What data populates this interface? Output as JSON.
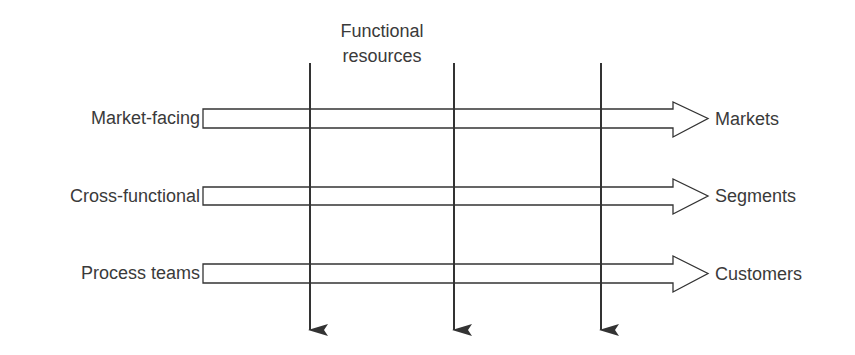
{
  "diagram": {
    "title": [
      "Functional",
      "resources"
    ],
    "colors": {
      "stroke": "#333333",
      "text": "#3a3a3a",
      "background": "#ffffff"
    },
    "vertical_arrows": [
      {
        "x": 310,
        "y_start": 63,
        "y_end": 336
      },
      {
        "x": 454,
        "y_start": 63,
        "y_end": 336
      },
      {
        "x": 601,
        "y_start": 63,
        "y_end": 336
      }
    ],
    "rows": [
      {
        "left_label": "Market-facing",
        "right_label": "Markets",
        "y_top": 109,
        "y_bottom": 128
      },
      {
        "left_label": "Cross-functional",
        "right_label": "Segments",
        "y_top": 187,
        "y_bottom": 205
      },
      {
        "left_label": "Process teams",
        "right_label": "Customers",
        "y_top": 264,
        "y_bottom": 283
      }
    ]
  }
}
